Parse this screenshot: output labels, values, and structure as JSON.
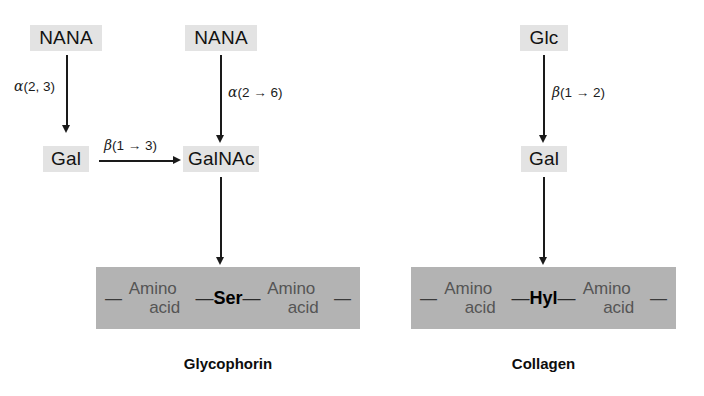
{
  "figure": {
    "panels": [
      {
        "id": "glycophorin",
        "caption": "Glycophorin",
        "residues": {
          "nana_left": "NANA",
          "nana_right": "NANA",
          "gal": "Gal",
          "galnac": "GalNAc"
        },
        "linkages": {
          "nana_to_gal": {
            "greek": "α",
            "spec": "(2, 3)"
          },
          "gal_to_galnac": {
            "greek": "β",
            "spec": "(1 → 3)"
          },
          "nana_to_galnac": {
            "greek": "α",
            "spec": "(2 → 6)"
          }
        },
        "peptide": {
          "left_dash": "—",
          "right_dash": "—",
          "left_residue": {
            "line1": "Amino",
            "line2": "acid"
          },
          "right_residue": {
            "line1": "Amino",
            "line2": "acid"
          },
          "anchor": "Ser",
          "anchor_left_tie": "—",
          "anchor_right_tie": "—"
        }
      },
      {
        "id": "collagen",
        "caption": "Collagen",
        "residues": {
          "glc": "Glc",
          "gal": "Gal"
        },
        "linkages": {
          "glc_to_gal": {
            "greek": "β",
            "spec": "(1 → 2)"
          }
        },
        "peptide": {
          "left_dash": "—",
          "right_dash": "—",
          "left_residue": {
            "line1": "Amino",
            "line2": "acid"
          },
          "right_residue": {
            "line1": "Amino",
            "line2": "acid"
          },
          "anchor": "Hyl",
          "anchor_left_tie": "—",
          "anchor_right_tie": "—"
        }
      }
    ],
    "colors": {
      "sugar_chip_bg": "#e3e3e3",
      "peptide_bar_bg": "#b3b3b3",
      "ink": "#1a1a1a",
      "page_bg": "#ffffff"
    }
  }
}
